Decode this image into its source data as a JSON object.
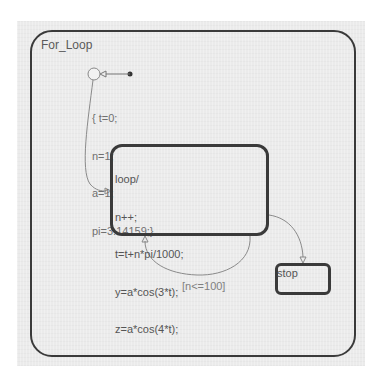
{
  "chart": {
    "parent_state": {
      "name": "For_Loop"
    },
    "states": [
      {
        "id": "loop",
        "lines": [
          "loop/",
          "n++;",
          "t=t+n*pi/1000;",
          "y=a*cos(3*t);",
          "z=a*cos(4*t);"
        ]
      },
      {
        "id": "stop",
        "lines": [
          "stop"
        ]
      }
    ],
    "default_transition": {
      "action_lines": [
        "{ t=0;",
        "n=1;",
        "a=1;",
        "pi=3.14159;}"
      ]
    },
    "transitions": [
      {
        "from": "junction",
        "to": "loop",
        "label": ""
      },
      {
        "from": "loop",
        "to": "loop",
        "label": "[n<=100]"
      },
      {
        "from": "loop",
        "to": "stop",
        "label": ""
      }
    ]
  },
  "colors": {
    "background": "#ebebeb",
    "state_border": "#3a3a3a",
    "transition": "#8a8a8a",
    "text": "#555555"
  }
}
